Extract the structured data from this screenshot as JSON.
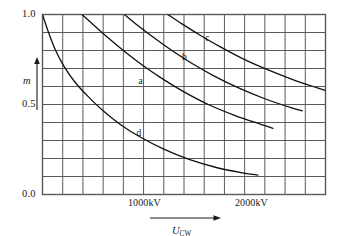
{
  "chart_data": {
    "type": "line",
    "title": "",
    "subtitle": "",
    "xlabel": "U_CW",
    "xlabel_base": "U",
    "xlabel_sub": "CW",
    "ylabel": "m",
    "grid": true,
    "legend_position": "inline-labels",
    "xlim": [
      0,
      2800
    ],
    "ylim": [
      0.0,
      1.0
    ],
    "x_major_ticks": [
      1000,
      2000
    ],
    "x_tick_labels": [
      "1000kV",
      "2000kV"
    ],
    "y_major_ticks": [
      0.0,
      0.5,
      1.0
    ],
    "y_tick_labels": [
      "0.0",
      "0.5",
      "1.0"
    ],
    "x_grid_step": 200,
    "y_grid_step": 0.1,
    "x_grid_count": 14,
    "y_grid_count": 10,
    "axis_units": "kV",
    "series": [
      {
        "name": "d",
        "label": "d",
        "label_x": 960,
        "label_y": 0.335,
        "points": [
          [
            0,
            1.0
          ],
          [
            60,
            0.9
          ],
          [
            130,
            0.8
          ],
          [
            210,
            0.715
          ],
          [
            320,
            0.625
          ],
          [
            450,
            0.545
          ],
          [
            600,
            0.465
          ],
          [
            780,
            0.385
          ],
          [
            980,
            0.315
          ],
          [
            1200,
            0.252
          ],
          [
            1450,
            0.195
          ],
          [
            1720,
            0.15
          ],
          [
            1980,
            0.12
          ],
          [
            2130,
            0.108
          ]
        ]
      },
      {
        "name": "a",
        "label": "a",
        "label_x": 980,
        "label_y": 0.625,
        "points": [
          [
            390,
            1.0
          ],
          [
            500,
            0.945
          ],
          [
            640,
            0.875
          ],
          [
            800,
            0.8
          ],
          [
            980,
            0.722
          ],
          [
            1180,
            0.645
          ],
          [
            1400,
            0.57
          ],
          [
            1640,
            0.5
          ],
          [
            1900,
            0.44
          ],
          [
            2160,
            0.39
          ],
          [
            2280,
            0.368
          ]
        ]
      },
      {
        "name": "b",
        "label": "b",
        "label_x": 1410,
        "label_y": 0.76,
        "points": [
          [
            810,
            1.0
          ],
          [
            940,
            0.94
          ],
          [
            1100,
            0.872
          ],
          [
            1280,
            0.8
          ],
          [
            1480,
            0.728
          ],
          [
            1700,
            0.658
          ],
          [
            1940,
            0.592
          ],
          [
            2200,
            0.532
          ],
          [
            2460,
            0.482
          ],
          [
            2570,
            0.465
          ]
        ]
      },
      {
        "name": "c",
        "label": "c",
        "label_x": 1640,
        "label_y": 0.862,
        "points": [
          [
            1240,
            1.0
          ],
          [
            1380,
            0.948
          ],
          [
            1560,
            0.885
          ],
          [
            1760,
            0.82
          ],
          [
            1980,
            0.755
          ],
          [
            2220,
            0.695
          ],
          [
            2470,
            0.64
          ],
          [
            2720,
            0.592
          ],
          [
            2800,
            0.578
          ]
        ]
      }
    ]
  },
  "axes": {
    "y_label": "m",
    "y_ticks": [
      {
        "value": "1.0"
      },
      {
        "value": "0.5"
      },
      {
        "value": "0.0"
      }
    ],
    "x_ticks": [
      {
        "value": "1000kV"
      },
      {
        "value": "2000kV"
      }
    ],
    "x_label_base": "U",
    "x_label_sub": "CW"
  },
  "curve_labels": {
    "a": "a",
    "b": "b",
    "c": "c",
    "d": "d"
  },
  "colors": {
    "grid": "#5a5a5a",
    "curve": "#111111",
    "text": "#1a1a1a",
    "background": "#ffffff"
  }
}
